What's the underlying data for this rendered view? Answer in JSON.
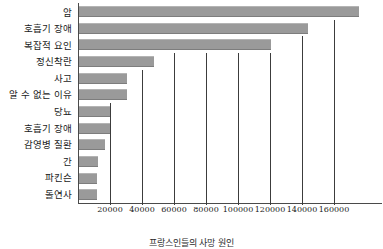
{
  "chart_data": {
    "type": "bar",
    "orientation": "horizontal",
    "title": "",
    "caption": "프랑스인들의 사망 원인",
    "xlabel": "",
    "ylabel": "",
    "xlim": [
      0,
      190000
    ],
    "grid": true,
    "legend": null,
    "bar_color": "#9a9a9a",
    "axis_color": "#4a4a4a",
    "categories": [
      "암",
      "호흡기 장애",
      "복잡적 요인",
      "정신착란",
      "사고",
      "알 수 없는 이유",
      "당뇨",
      "호흡기 장애",
      "감영병 질환",
      "간",
      "파킨슨",
      "돌연사"
    ],
    "values": [
      175000,
      143000,
      120000,
      47000,
      30000,
      30000,
      19500,
      19500,
      16000,
      12000,
      11000,
      11000
    ],
    "xticks": [
      20000,
      40000,
      60000,
      80000,
      100000,
      120000,
      140000,
      160000
    ],
    "xtick_labels": [
      "20000",
      "40000",
      "60000",
      "80000",
      "100000",
      "120000",
      "140000",
      "160000"
    ]
  }
}
